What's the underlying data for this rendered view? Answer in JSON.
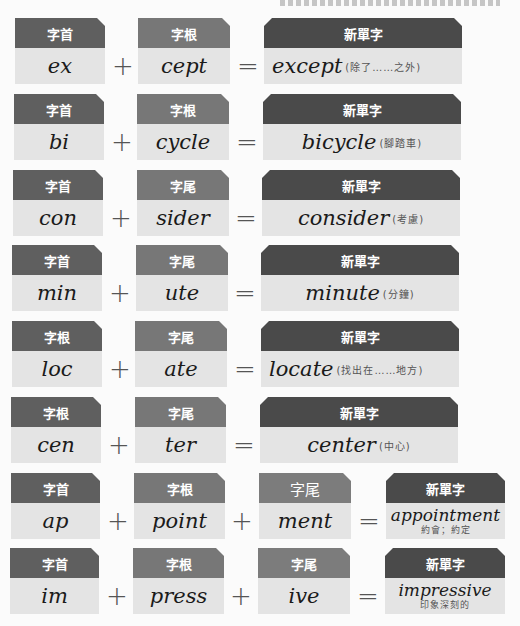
{
  "colors": {
    "prefix_header": "#5f5f5f",
    "middle_header": "#777777",
    "suffix_header": "#7c7c7c",
    "new_word_header": "#4a4a4a",
    "body": "#e4e4e4"
  },
  "operators": {
    "plus": "+",
    "equals": "="
  },
  "rows": [
    {
      "parts": [
        {
          "label": "字首",
          "text": "ex"
        },
        {
          "label": "字根",
          "text": "cept"
        }
      ],
      "result": {
        "label": "新單字",
        "word": "except",
        "meaning": "(除了……之外)"
      }
    },
    {
      "parts": [
        {
          "label": "字首",
          "text": "bi"
        },
        {
          "label": "字根",
          "text": "cycle"
        }
      ],
      "result": {
        "label": "新單字",
        "word": "bicycle",
        "meaning": "(腳踏車)"
      }
    },
    {
      "parts": [
        {
          "label": "字首",
          "text": "con"
        },
        {
          "label": "字尾",
          "text": "sider"
        }
      ],
      "result": {
        "label": "新單字",
        "word": "consider",
        "meaning": "(考慮)"
      }
    },
    {
      "parts": [
        {
          "label": "字首",
          "text": "min"
        },
        {
          "label": "字尾",
          "text": "ute"
        }
      ],
      "result": {
        "label": "新單字",
        "word": "minute",
        "meaning": "(分鐘)"
      }
    },
    {
      "parts": [
        {
          "label": "字根",
          "text": "loc"
        },
        {
          "label": "字尾",
          "text": "ate"
        }
      ],
      "result": {
        "label": "新單字",
        "word": "locate",
        "meaning": "(找出在……地方)"
      }
    },
    {
      "parts": [
        {
          "label": "字根",
          "text": "cen"
        },
        {
          "label": "字尾",
          "text": "ter"
        }
      ],
      "result": {
        "label": "新單字",
        "word": "center",
        "meaning": "(中心)"
      }
    },
    {
      "parts": [
        {
          "label": "字首",
          "text": "ap"
        },
        {
          "label": "字根",
          "text": "point"
        },
        {
          "label": "字尾",
          "text": "ment"
        }
      ],
      "result": {
        "label": "新單字",
        "word": "appointment",
        "meaning": "約會；約定"
      }
    },
    {
      "parts": [
        {
          "label": "字首",
          "text": "im"
        },
        {
          "label": "字根",
          "text": "press"
        },
        {
          "label": "字尾",
          "text": "ive"
        }
      ],
      "result": {
        "label": "新單字",
        "word": "impressive",
        "meaning": "印象深刻的"
      }
    }
  ]
}
